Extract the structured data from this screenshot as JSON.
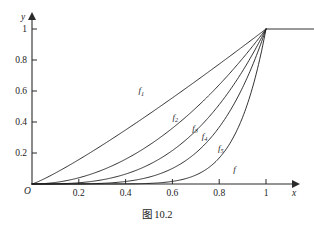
{
  "figure": {
    "caption": "图 10.2",
    "axes": {
      "x_name": "x",
      "y_name": "y",
      "origin_label": "O",
      "x_ticks": [
        "0.2",
        "0.4",
        "0.6",
        "0.8",
        "1"
      ],
      "y_ticks": [
        "0.2",
        "0.4",
        "0.6",
        "0.8",
        "1"
      ]
    }
  },
  "chart_data": {
    "type": "line",
    "title": "图 10.2",
    "xlabel": "x",
    "ylabel": "y",
    "xlim": [
      0,
      1.27
    ],
    "ylim": [
      0,
      1.08
    ],
    "grid": false,
    "legend": "inline-curve-labels",
    "x_ticks": [
      0.2,
      0.4,
      0.6,
      0.8,
      1
    ],
    "y_ticks": [
      0.2,
      0.4,
      0.6,
      0.8,
      1
    ],
    "note": "Family of power functions f_n(x)=x^p on [0,1], each continued as constant 1 for x>1, converging pointwise to the limit function f.",
    "series": [
      {
        "name": "f1",
        "label": "f",
        "sub": "1",
        "exponent": 1.15,
        "label_pos": {
          "x": 0.455,
          "y": 0.585
        },
        "x": [
          0,
          0.1,
          0.2,
          0.3,
          0.4,
          0.5,
          0.6,
          0.7,
          0.8,
          0.9,
          1.0
        ],
        "values": [
          0,
          0.072,
          0.16,
          0.255,
          0.356,
          0.461,
          0.569,
          0.681,
          0.795,
          0.912,
          1.0
        ]
      },
      {
        "name": "f2",
        "label": "f",
        "sub": "2",
        "exponent": 2.0,
        "label_pos": {
          "x": 0.6,
          "y": 0.415
        },
        "x": [
          0,
          0.1,
          0.2,
          0.3,
          0.4,
          0.5,
          0.6,
          0.7,
          0.8,
          0.9,
          1.0
        ],
        "values": [
          0,
          0.01,
          0.04,
          0.09,
          0.16,
          0.25,
          0.36,
          0.49,
          0.64,
          0.81,
          1.0
        ]
      },
      {
        "name": "f3",
        "label": "f",
        "sub": "3",
        "exponent": 3.0,
        "label_pos": {
          "x": 0.685,
          "y": 0.345
        },
        "x": [
          0,
          0.1,
          0.2,
          0.3,
          0.4,
          0.5,
          0.6,
          0.7,
          0.8,
          0.9,
          1.0
        ],
        "values": [
          0,
          0.001,
          0.008,
          0.027,
          0.064,
          0.125,
          0.216,
          0.343,
          0.512,
          0.729,
          1.0
        ]
      },
      {
        "name": "f4",
        "label": "f",
        "sub": "4",
        "exponent": 4.5,
        "label_pos": {
          "x": 0.725,
          "y": 0.29
        },
        "x": [
          0,
          0.1,
          0.2,
          0.3,
          0.4,
          0.5,
          0.6,
          0.7,
          0.8,
          0.9,
          1.0
        ],
        "values": [
          0,
          0.0,
          0.001,
          0.005,
          0.018,
          0.044,
          0.093,
          0.177,
          0.312,
          0.524,
          1.0
        ]
      },
      {
        "name": "f5",
        "label": "f",
        "sub": "5",
        "exponent": 8.0,
        "label_pos": {
          "x": 0.795,
          "y": 0.215
        },
        "x": [
          0,
          0.1,
          0.2,
          0.3,
          0.4,
          0.5,
          0.6,
          0.7,
          0.8,
          0.9,
          1.0
        ],
        "values": [
          0,
          0.0,
          0.0,
          0.0,
          0.001,
          0.004,
          0.017,
          0.058,
          0.168,
          0.43,
          1.0
        ]
      }
    ],
    "limit_function": {
      "name": "f",
      "label": "f",
      "label_pos": {
        "x": 0.86,
        "y": 0.075
      },
      "description": "Limit function: 0 on [0,1), 1 at x=1 and beyond",
      "segment_x": [
        1.0,
        1.27
      ],
      "segment_y": [
        1.0,
        1.0
      ]
    }
  }
}
